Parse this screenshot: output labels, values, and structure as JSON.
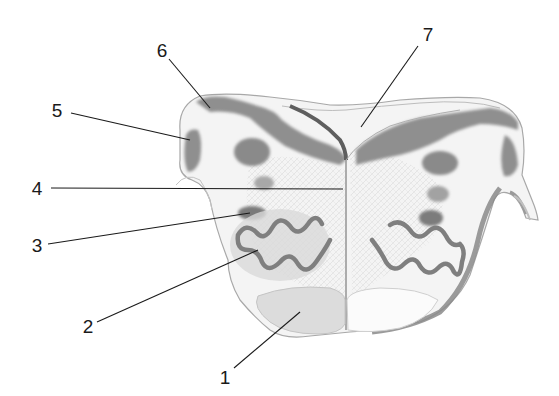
{
  "diagram": {
    "type": "anatomical-cross-section",
    "colors": {
      "background": "#ffffff",
      "tissue": "#f2f2f2",
      "grey_matter": "#8e8e8e",
      "dark_grey": "#6f6f6f",
      "pyramid": "#dcdcdc",
      "outline": "#9a9a9a",
      "leader_line": "#1a1a1a"
    },
    "labels": [
      {
        "id": "1",
        "text": "1",
        "x": 225,
        "y": 377,
        "line": [
          [
            234,
            368
          ],
          [
            300,
            312
          ]
        ]
      },
      {
        "id": "2",
        "text": "2",
        "x": 88,
        "y": 326,
        "line": [
          [
            97,
            322
          ],
          [
            258,
            250
          ]
        ]
      },
      {
        "id": "3",
        "text": "3",
        "x": 37,
        "y": 245,
        "line": [
          [
            48,
            244
          ],
          [
            250,
            213
          ]
        ]
      },
      {
        "id": "4",
        "text": "4",
        "x": 37,
        "y": 188,
        "line": [
          [
            51,
            188
          ],
          [
            343,
            189
          ]
        ]
      },
      {
        "id": "5",
        "text": "5",
        "x": 57,
        "y": 110,
        "line": [
          [
            71,
            113
          ],
          [
            190,
            140
          ]
        ]
      },
      {
        "id": "6",
        "text": "6",
        "x": 162,
        "y": 50,
        "line": [
          [
            169,
            59
          ],
          [
            210,
            108
          ]
        ]
      },
      {
        "id": "7",
        "text": "7",
        "x": 428,
        "y": 34,
        "line": [
          [
            418,
            46
          ],
          [
            361,
            127
          ]
        ]
      }
    ]
  }
}
